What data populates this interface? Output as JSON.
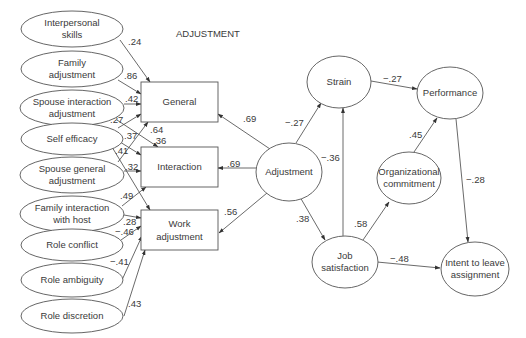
{
  "diagram": {
    "section_label": "ADJUSTMENT",
    "antecedents": [
      {
        "id": "interpersonal",
        "lines": [
          "Interpersonal",
          "skills"
        ],
        "cx": 72,
        "cy": 29
      },
      {
        "id": "family_adj",
        "lines": [
          "Family",
          "adjustment"
        ],
        "cx": 72,
        "cy": 69
      },
      {
        "id": "spouse_inter",
        "lines": [
          "Spouse interaction",
          "adjustment"
        ],
        "cx": 72,
        "cy": 108
      },
      {
        "id": "self_eff",
        "lines": [
          "Self efficacy"
        ],
        "cx": 72,
        "cy": 138
      },
      {
        "id": "spouse_gen",
        "lines": [
          "Spouse general",
          "adjustment"
        ],
        "cx": 72,
        "cy": 174
      },
      {
        "id": "fam_host",
        "lines": [
          "Family interaction",
          "with host"
        ],
        "cx": 72,
        "cy": 214
      },
      {
        "id": "role_conf",
        "lines": [
          "Role conflict"
        ],
        "cx": 72,
        "cy": 244
      },
      {
        "id": "role_amb",
        "lines": [
          "Role ambiguity"
        ],
        "cx": 72,
        "cy": 280
      },
      {
        "id": "role_disc",
        "lines": [
          "Role discretion"
        ],
        "cx": 72,
        "cy": 316
      }
    ],
    "boxes": [
      {
        "id": "general",
        "lines": [
          "General"
        ],
        "x": 141,
        "y": 82,
        "w": 77,
        "h": 40
      },
      {
        "id": "interaction",
        "lines": [
          "Interaction"
        ],
        "x": 141,
        "y": 147,
        "w": 77,
        "h": 40
      },
      {
        "id": "work",
        "lines": [
          "Work",
          "adjustment"
        ],
        "x": 141,
        "y": 210,
        "w": 77,
        "h": 40
      }
    ],
    "latents": [
      {
        "id": "adjustment",
        "lines": [
          "Adjustment"
        ],
        "cx": 289,
        "cy": 172,
        "rx": 33,
        "ry": 29
      },
      {
        "id": "strain",
        "lines": [
          "Strain"
        ],
        "cx": 339,
        "cy": 82,
        "rx": 32,
        "ry": 26
      },
      {
        "id": "performance",
        "lines": [
          "Performance"
        ],
        "cx": 450,
        "cy": 93,
        "rx": 33,
        "ry": 26
      },
      {
        "id": "org_commit",
        "lines": [
          "Organizational",
          "commitment"
        ],
        "cx": 409,
        "cy": 178,
        "rx": 32,
        "ry": 26
      },
      {
        "id": "job_sat",
        "lines": [
          "Job",
          "satisfaction"
        ],
        "cx": 345,
        "cy": 262,
        "rx": 33,
        "ry": 26
      },
      {
        "id": "intent",
        "lines": [
          "Intent to leave",
          "assignment"
        ],
        "cx": 475,
        "cy": 269,
        "rx": 34,
        "ry": 27
      }
    ],
    "edges": [
      {
        "from": "interpersonal",
        "to": "general",
        "coef": ".24"
      },
      {
        "from": "family_adj",
        "to": "general",
        "coef": ".86"
      },
      {
        "from": "spouse_inter",
        "to": "general",
        "coef": ".42"
      },
      {
        "from": "spouse_inter",
        "to": "interaction",
        "coef": ".27"
      },
      {
        "from": "self_eff",
        "to": "general",
        "coef": ".37"
      },
      {
        "from": "self_eff",
        "to": "interaction",
        "coef": ".41"
      },
      {
        "from": "self_eff",
        "to": "work",
        "coef": ".64"
      },
      {
        "from": "spouse_gen",
        "to": "interaction",
        "coef": ".32"
      },
      {
        "from": "spouse_gen",
        "to": "general",
        "coef": ".36"
      },
      {
        "from": "fam_host",
        "to": "interaction",
        "coef": ".49"
      },
      {
        "from": "fam_host",
        "to": "work",
        "coef": ".28"
      },
      {
        "from": "role_conf",
        "to": "work",
        "coef": "−.46"
      },
      {
        "from": "role_amb",
        "to": "work",
        "coef": "−.41"
      },
      {
        "from": "role_disc",
        "to": "work",
        "coef": ".43"
      },
      {
        "from": "adjustment",
        "to": "general",
        "coef": ".69"
      },
      {
        "from": "adjustment",
        "to": "interaction",
        "coef": ".69"
      },
      {
        "from": "adjustment",
        "to": "work",
        "coef": ".56"
      },
      {
        "from": "adjustment",
        "to": "strain",
        "coef": "−.27"
      },
      {
        "from": "adjustment",
        "to": "job_sat",
        "coef": ".38"
      },
      {
        "from": "job_sat",
        "to": "strain",
        "coef": "−.36"
      },
      {
        "from": "strain",
        "to": "performance",
        "coef": "−.27"
      },
      {
        "from": "job_sat",
        "to": "org_commit",
        "coef": ".58"
      },
      {
        "from": "org_commit",
        "to": "performance",
        "coef": ".45"
      },
      {
        "from": "performance",
        "to": "intent",
        "coef": "−.28"
      },
      {
        "from": "job_sat",
        "to": "intent",
        "coef": "−.48"
      }
    ]
  }
}
